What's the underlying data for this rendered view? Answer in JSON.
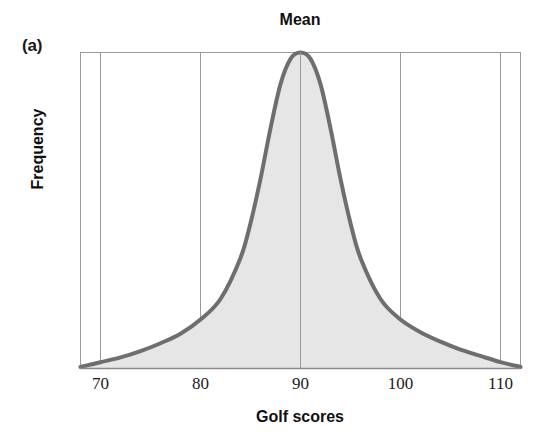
{
  "figure": {
    "panel_label": "(a)",
    "title": "Mean"
  },
  "chart_data": {
    "type": "area",
    "title": "Mean",
    "xlabel": "Golf scores",
    "ylabel": "Frequency",
    "xlim": [
      68,
      112
    ],
    "ylim": [
      0,
      1
    ],
    "grid": true,
    "legend": null,
    "annotations": [
      {
        "text": "Mean",
        "x": 90,
        "note": "vertical gridline at the distribution peak marks the mean"
      }
    ],
    "xticks": [
      70,
      80,
      90,
      100,
      110
    ],
    "xtick_labels": [
      "70",
      "80",
      "90",
      "100",
      "110"
    ],
    "yticks": [],
    "ytick_labels": [],
    "series": [
      {
        "name": "Golf score frequency distribution",
        "shape": "symmetric unimodal bell with heavy tails, mean = mode = median = 90",
        "x": [
          68,
          70,
          72,
          74,
          76,
          78,
          80,
          82,
          84,
          85,
          86,
          87,
          88,
          89,
          90,
          91,
          92,
          93,
          94,
          95,
          96,
          98,
          100,
          102,
          104,
          106,
          108,
          110,
          112
        ],
        "y": [
          0.005,
          0.02,
          0.035,
          0.055,
          0.08,
          0.11,
          0.155,
          0.22,
          0.35,
          0.46,
          0.6,
          0.76,
          0.9,
          0.98,
          1.0,
          0.98,
          0.9,
          0.76,
          0.6,
          0.46,
          0.35,
          0.22,
          0.155,
          0.115,
          0.085,
          0.06,
          0.04,
          0.02,
          0.005
        ]
      }
    ],
    "colors": {
      "curve": "#6e6e6e",
      "fill": "#e6e6e6",
      "grid": "#9a9a9a",
      "axis": "#8c8c8c",
      "text": "#111111"
    }
  },
  "axis": {
    "x_ticks": [
      {
        "label": "70",
        "value": 70
      },
      {
        "label": "80",
        "value": 80
      },
      {
        "label": "90",
        "value": 90
      },
      {
        "label": "100",
        "value": 100
      },
      {
        "label": "110",
        "value": 110
      }
    ],
    "x_title": "Golf scores",
    "y_title": "Frequency"
  }
}
